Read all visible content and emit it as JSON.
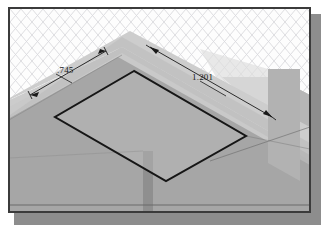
{
  "window": {
    "title": "Isometric CAD Viewport",
    "border_color": "#3b3b3b",
    "shadow_color": "#8d8d8d",
    "background_color": "#fdfdfd"
  },
  "viewport": {
    "grid": {
      "name": "isometric-grid",
      "color": "#d8d8dc",
      "spacing_x": 22,
      "spacing_y": 13,
      "visible": true
    },
    "model": {
      "name": "stepped-block",
      "faces": [
        {
          "name": "base-top-face",
          "color": "#c9c9c9"
        },
        {
          "name": "upper-top-face",
          "color": "#cfcfcf"
        },
        {
          "name": "left-front-face",
          "color": "#9b9b9b"
        },
        {
          "name": "right-front-face",
          "color": "#a8a8a8"
        },
        {
          "name": "right-side-wall",
          "color": "#b4b4b4"
        },
        {
          "name": "vertical-edge-band",
          "color": "#8f8f8f"
        }
      ],
      "sketch_profile": {
        "name": "rectangular-sketch-profile",
        "color": "#1a1a1a",
        "closed": true
      }
    },
    "dimensions": [
      {
        "id": "dim-745",
        "label": ".745",
        "name": "dimension-745",
        "color": "#1a1a1a"
      },
      {
        "id": "dim-1201",
        "label": "1.201",
        "name": "dimension-1201",
        "color": "#1a1a1a"
      }
    ]
  }
}
